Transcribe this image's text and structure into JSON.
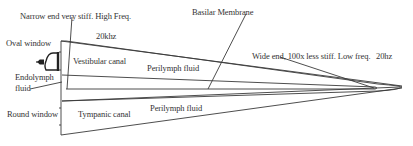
{
  "diagram": {
    "colors": {
      "line": "#3a3a3a",
      "text": "#333333",
      "background": "#ffffff"
    },
    "labels": {
      "narrow_end": "Narrow end very stiff. High Freq.",
      "basilar_membrane": "Basilar Membrane",
      "freq_high": "20khz",
      "oval_window": "Oval window",
      "vestibular_canal": "Vestibular canal",
      "perilymph_upper": "Perilymph fluid",
      "wide_end": "Wide end, 100x less stiff. Low freq.",
      "freq_low": "20hz",
      "endolymph_line1": "Endolymph",
      "endolymph_line2": "fluid",
      "round_window": "Round window",
      "tympanic_canal": "Tympanic canal",
      "perilymph_lower": "Perilymph fluid"
    },
    "icons": {
      "stapes": "stapes-icon"
    }
  }
}
